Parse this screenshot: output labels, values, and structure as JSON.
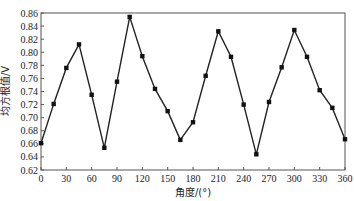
{
  "chart_data": {
    "type": "line",
    "title": "",
    "xlabel": "角度/(°)",
    "ylabel": "均方根值/V",
    "xlim": [
      0,
      360
    ],
    "ylim": [
      0.62,
      0.86
    ],
    "grid": false,
    "legend": null,
    "x_ticks": [
      0,
      30,
      60,
      90,
      120,
      150,
      180,
      210,
      240,
      270,
      300,
      330,
      360
    ],
    "y_ticks": [
      0.62,
      0.64,
      0.66,
      0.68,
      0.7,
      0.72,
      0.74,
      0.76,
      0.78,
      0.8,
      0.82,
      0.84,
      0.86
    ],
    "x_tick_labels": [
      "0",
      "30",
      "60",
      "90",
      "120",
      "150",
      "180",
      "210",
      "240",
      "270",
      "300",
      "330",
      "360"
    ],
    "y_tick_labels": [
      "0.62",
      "0.64",
      "0.66",
      "0.68",
      "0.70",
      "0.72",
      "0.74",
      "0.76",
      "0.78",
      "0.80",
      "0.82",
      "0.84",
      "0.86"
    ],
    "series": [
      {
        "name": "均方根值",
        "marker": "square",
        "color": "#222222",
        "x": [
          0,
          15,
          30,
          45,
          60,
          75,
          90,
          105,
          120,
          135,
          150,
          165,
          180,
          195,
          210,
          225,
          240,
          255,
          270,
          285,
          300,
          315,
          330,
          345,
          360
        ],
        "values": [
          0.661,
          0.721,
          0.776,
          0.812,
          0.735,
          0.654,
          0.755,
          0.854,
          0.794,
          0.744,
          0.71,
          0.666,
          0.693,
          0.764,
          0.832,
          0.793,
          0.72,
          0.644,
          0.724,
          0.777,
          0.834,
          0.793,
          0.742,
          0.715,
          0.667
        ]
      }
    ]
  }
}
